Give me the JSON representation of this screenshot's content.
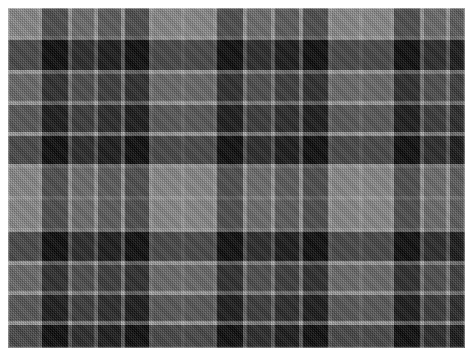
{
  "image": {
    "kind": "textile-swatch",
    "subject": "grayscale tartan plaid fabric",
    "width_px": 473,
    "height_px": 356,
    "background_color": "#ffffff",
    "margin_px": 8,
    "swatch": {
      "x": 8,
      "y": 8,
      "width": 457,
      "height": 340
    },
    "weave": "2/2 twill, 45 degree diagonal",
    "alt_text": "A rectangular swatch of grayscale tartan plaid cloth with light gray, mid gray, dark gray and black checks separated by thin pale guard lines, woven in a visible diagonal twill."
  },
  "palette": {
    "light_gray": "#8f8f8f",
    "guard_line": "#b0b0b0",
    "mid_gray": "#4d4d4d",
    "dark_gray": "#262626",
    "black": "#050505",
    "paper_white": "#ffffff"
  },
  "sett": {
    "description": "Symmetric tartan sett. Warp and weft use the same colour sequence and proportions; the warp repeats about 3.5 times across the width and the weft about 2.6 times down the height.",
    "unit": "px",
    "warp_repeat_px": 131,
    "weft_repeat_px": 131,
    "sequence": [
      {
        "color_key": "light_gray",
        "threads_px": 26
      },
      {
        "color_key": "guard_line",
        "threads_px": 4
      },
      {
        "color_key": "black",
        "threads_px": 26
      },
      {
        "color_key": "guard_line",
        "threads_px": 4
      },
      {
        "color_key": "mid_gray",
        "threads_px": 22
      },
      {
        "color_key": "guard_line",
        "threads_px": 4
      },
      {
        "color_key": "dark_gray",
        "threads_px": 22
      },
      {
        "color_key": "guard_line",
        "threads_px": 4
      },
      {
        "color_key": "black",
        "threads_px": 19
      }
    ]
  },
  "warp_bands": [
    {
      "x": 0,
      "w": 30,
      "color_key": "light_gray"
    },
    {
      "x": 30,
      "w": 4,
      "color_key": "guard_line"
    },
    {
      "x": 34,
      "w": 26,
      "color_key": "black"
    },
    {
      "x": 60,
      "w": 4,
      "color_key": "guard_line"
    },
    {
      "x": 64,
      "w": 22,
      "color_key": "mid_gray"
    },
    {
      "x": 86,
      "w": 4,
      "color_key": "guard_line"
    },
    {
      "x": 90,
      "w": 23,
      "color_key": "dark_gray"
    },
    {
      "x": 113,
      "w": 4,
      "color_key": "guard_line"
    },
    {
      "x": 117,
      "w": 24,
      "color_key": "black"
    },
    {
      "x": 141,
      "w": 4,
      "color_key": "guard_line"
    },
    {
      "x": 145,
      "w": 28,
      "color_key": "light_gray"
    },
    {
      "x": 173,
      "w": 4,
      "color_key": "guard_line"
    },
    {
      "x": 177,
      "w": 28,
      "color_key": "light_gray"
    },
    {
      "x": 205,
      "w": 4,
      "color_key": "guard_line"
    },
    {
      "x": 209,
      "w": 26,
      "color_key": "black"
    },
    {
      "x": 235,
      "w": 4,
      "color_key": "guard_line"
    },
    {
      "x": 239,
      "w": 24,
      "color_key": "mid_gray"
    },
    {
      "x": 263,
      "w": 4,
      "color_key": "guard_line"
    },
    {
      "x": 267,
      "w": 24,
      "color_key": "dark_gray"
    },
    {
      "x": 291,
      "w": 4,
      "color_key": "guard_line"
    },
    {
      "x": 295,
      "w": 25,
      "color_key": "black"
    },
    {
      "x": 320,
      "w": 4,
      "color_key": "guard_line"
    },
    {
      "x": 324,
      "w": 27,
      "color_key": "light_gray"
    },
    {
      "x": 351,
      "w": 4,
      "color_key": "guard_line"
    },
    {
      "x": 355,
      "w": 27,
      "color_key": "light_gray"
    },
    {
      "x": 382,
      "w": 4,
      "color_key": "guard_line"
    },
    {
      "x": 386,
      "w": 26,
      "color_key": "black"
    },
    {
      "x": 412,
      "w": 4,
      "color_key": "guard_line"
    },
    {
      "x": 416,
      "w": 22,
      "color_key": "mid_gray"
    },
    {
      "x": 438,
      "w": 4,
      "color_key": "guard_line"
    },
    {
      "x": 442,
      "w": 15,
      "color_key": "dark_gray"
    }
  ],
  "weft_bands": [
    {
      "y": 0,
      "h": 28,
      "color_key": "light_gray"
    },
    {
      "y": 28,
      "h": 4,
      "color_key": "guard_line"
    },
    {
      "y": 32,
      "h": 30,
      "color_key": "black"
    },
    {
      "y": 62,
      "h": 4,
      "color_key": "guard_line"
    },
    {
      "y": 66,
      "h": 27,
      "color_key": "mid_gray"
    },
    {
      "y": 93,
      "h": 4,
      "color_key": "guard_line"
    },
    {
      "y": 97,
      "h": 27,
      "color_key": "dark_gray"
    },
    {
      "y": 124,
      "h": 4,
      "color_key": "guard_line"
    },
    {
      "y": 128,
      "h": 28,
      "color_key": "black"
    },
    {
      "y": 156,
      "h": 4,
      "color_key": "guard_line"
    },
    {
      "y": 160,
      "h": 28,
      "color_key": "light_gray"
    },
    {
      "y": 188,
      "h": 4,
      "color_key": "guard_line"
    },
    {
      "y": 192,
      "h": 28,
      "color_key": "light_gray"
    },
    {
      "y": 220,
      "h": 4,
      "color_key": "guard_line"
    },
    {
      "y": 224,
      "h": 29,
      "color_key": "black"
    },
    {
      "y": 253,
      "h": 4,
      "color_key": "guard_line"
    },
    {
      "y": 257,
      "h": 26,
      "color_key": "mid_gray"
    },
    {
      "y": 283,
      "h": 4,
      "color_key": "guard_line"
    },
    {
      "y": 287,
      "h": 26,
      "color_key": "dark_gray"
    },
    {
      "y": 313,
      "h": 4,
      "color_key": "guard_line"
    },
    {
      "y": 317,
      "h": 23,
      "color_key": "black"
    }
  ]
}
